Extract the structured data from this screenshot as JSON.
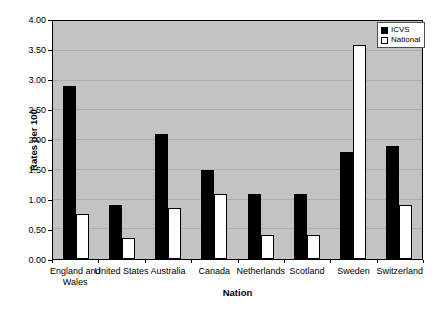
{
  "chart_data": {
    "type": "bar",
    "title": "",
    "xlabel": "Nation",
    "ylabel": "Rates per 100",
    "ylim": [
      0,
      4
    ],
    "ytick_step": 0.5,
    "ytick_labels": [
      "0.00",
      "0.50",
      "1.00",
      "1.50",
      "2.00",
      "2.50",
      "3.00",
      "3.50",
      "4.00"
    ],
    "grid": true,
    "legend_position": "top-right",
    "plot_bg_color": "#c3c3c3",
    "gridline_color": "#adadad",
    "categories": [
      "England and\nWales",
      "United States",
      "Australia",
      "Canada",
      "Netherlands",
      "Scotland",
      "Sweden",
      "Switzerland"
    ],
    "series": [
      {
        "name": "ICVS",
        "color": "#000000",
        "values": [
          2.9,
          0.9,
          2.1,
          1.5,
          1.1,
          1.1,
          1.8,
          1.9
        ]
      },
      {
        "name": "National",
        "color": "#ffffff",
        "values": [
          0.75,
          0.35,
          0.85,
          1.1,
          0.4,
          0.4,
          3.6,
          0.9
        ]
      }
    ]
  }
}
